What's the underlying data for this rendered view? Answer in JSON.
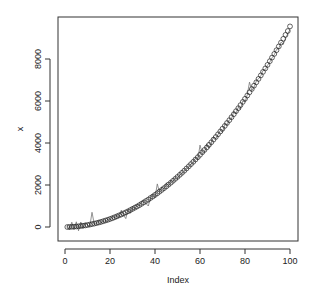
{
  "chart_data": {
    "type": "scatter",
    "title": "",
    "xlabel": "Index",
    "ylabel": "x",
    "xlim": [
      -3,
      104
    ],
    "ylim": [
      -600,
      10000
    ],
    "x_ticks": [
      0,
      20,
      40,
      60,
      80,
      100
    ],
    "y_ticks": [
      0,
      2000,
      4000,
      6000,
      8000
    ],
    "grid": false,
    "legend": null,
    "series": [
      {
        "name": "points",
        "style": "open-circle",
        "x": [
          1,
          2,
          3,
          4,
          5,
          6,
          7,
          8,
          9,
          10,
          11,
          12,
          13,
          14,
          15,
          16,
          17,
          18,
          19,
          20,
          21,
          22,
          23,
          24,
          25,
          26,
          27,
          28,
          29,
          30,
          31,
          32,
          33,
          34,
          35,
          36,
          37,
          38,
          39,
          40,
          41,
          42,
          43,
          44,
          45,
          46,
          47,
          48,
          49,
          50,
          51,
          52,
          53,
          54,
          55,
          56,
          57,
          58,
          59,
          60,
          61,
          62,
          63,
          64,
          65,
          66,
          67,
          68,
          69,
          70,
          71,
          72,
          73,
          74,
          75,
          76,
          77,
          78,
          79,
          80,
          81,
          82,
          83,
          84,
          85,
          86,
          87,
          88,
          89,
          90,
          91,
          92,
          93,
          94,
          95,
          96,
          97,
          98,
          99,
          100
        ],
        "values": [
          1,
          4,
          9,
          15,
          24,
          34,
          47,
          61,
          77,
          96,
          116,
          138,
          161,
          187,
          215,
          245,
          276,
          309,
          345,
          382,
          421,
          462,
          505,
          550,
          597,
          646,
          696,
          749,
          803,
          860,
          918,
          978,
          1040,
          1104,
          1170,
          1238,
          1307,
          1379,
          1453,
          1528,
          1605,
          1684,
          1766,
          1849,
          1934,
          2020,
          2109,
          2200,
          2293,
          2388,
          2484,
          2583,
          2683,
          2786,
          2890,
          2996,
          3104,
          3214,
          3325,
          3439,
          3555,
          3672,
          3791,
          3912,
          4035,
          4160,
          4287,
          4416,
          4547,
          4679,
          4814,
          4950,
          5088,
          5228,
          5370,
          5514,
          5659,
          5807,
          5956,
          6107,
          6260,
          6415,
          6572,
          6730,
          6891,
          7053,
          7217,
          7384,
          7551,
          7721,
          7893,
          8067,
          8242,
          8419,
          8598,
          8779,
          8962,
          9147,
          9333,
          9550
        ]
      },
      {
        "name": "noisy-line",
        "style": "line",
        "color": "#777777",
        "x": [
          1,
          2,
          3,
          4,
          5,
          6,
          7,
          8,
          9,
          10,
          11,
          12,
          13,
          14,
          15,
          16,
          17,
          18,
          19,
          20,
          21,
          22,
          23,
          24,
          25,
          26,
          27,
          28,
          29,
          30,
          31,
          32,
          33,
          34,
          35,
          36,
          37,
          38,
          39,
          40,
          41,
          42,
          43,
          44,
          45,
          46,
          47,
          48,
          49,
          50,
          51,
          52,
          53,
          54,
          55,
          56,
          57,
          58,
          59,
          60,
          61,
          62,
          63,
          64,
          65,
          66,
          67,
          68,
          69,
          70,
          71,
          72,
          73,
          74,
          75,
          76,
          77,
          78,
          79,
          80,
          81,
          82,
          83,
          84,
          85,
          86,
          87,
          88,
          89,
          90,
          91,
          92,
          93,
          94,
          95,
          96,
          97,
          98,
          99,
          100
        ],
        "values": [
          60,
          -140,
          230,
          -120,
          250,
          -180,
          240,
          -60,
          200,
          90,
          40,
          700,
          130,
          170,
          320,
          190,
          300,
          260,
          380,
          340,
          500,
          430,
          560,
          470,
          800,
          560,
          400,
          850,
          650,
          980,
          850,
          1080,
          1000,
          1200,
          1250,
          1120,
          1000,
          1380,
          1550,
          1400,
          2050,
          1650,
          1900,
          1800,
          2100,
          1950,
          2200,
          2150,
          2350,
          2300,
          2500,
          2550,
          2650,
          2800,
          2850,
          3000,
          3050,
          3300,
          3200,
          3900,
          3500,
          3550,
          3950,
          3750,
          4000,
          4300,
          4200,
          4400,
          4600,
          4500,
          4900,
          4850,
          5100,
          5150,
          5500,
          5400,
          5700,
          5600,
          6000,
          5950,
          6300,
          6900,
          6500,
          6650,
          6950,
          7050,
          7200,
          7450,
          7500,
          7700,
          7850,
          8050,
          8200,
          8450,
          8500,
          8800,
          8700,
          9000,
          9200,
          9400
        ]
      }
    ]
  }
}
